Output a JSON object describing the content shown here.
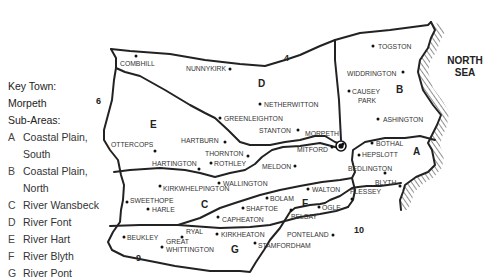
{
  "key": {
    "town_heading": "Key Town:",
    "town": "Morpeth",
    "subareas_heading": "Sub-Areas:",
    "subareas": [
      {
        "letter": "A",
        "line1": "Coastal Plain,",
        "line2": "South"
      },
      {
        "letter": "B",
        "line1": "Coastal Plain,",
        "line2": "North"
      },
      {
        "letter": "C",
        "line1": "River Wansbeck",
        "line2": ""
      },
      {
        "letter": "D",
        "line1": "River Font",
        "line2": ""
      },
      {
        "letter": "E",
        "line1": "River Hart",
        "line2": ""
      },
      {
        "letter": "F",
        "line1": "River Blyth",
        "line2": ""
      },
      {
        "letter": "G",
        "line1": "River Pont",
        "line2": ""
      }
    ]
  },
  "sea": {
    "line1": "NORTH",
    "line2": "SEA"
  },
  "area_labels": [
    {
      "t": "A",
      "x": 413,
      "y": 155
    },
    {
      "t": "B",
      "x": 396,
      "y": 93
    },
    {
      "t": "C",
      "x": 201,
      "y": 208
    },
    {
      "t": "D",
      "x": 258,
      "y": 87
    },
    {
      "t": "E",
      "x": 150,
      "y": 128
    },
    {
      "t": "F",
      "x": 302,
      "y": 207
    },
    {
      "t": "G",
      "x": 231,
      "y": 253
    }
  ],
  "boundary_numbers": [
    {
      "t": "4",
      "x": 284,
      "y": 61
    },
    {
      "t": "6",
      "x": 96,
      "y": 104
    },
    {
      "t": "9",
      "x": 136,
      "y": 261
    },
    {
      "t": "10",
      "x": 354,
      "y": 233
    }
  ],
  "towns": [
    {
      "name": "COMBILL",
      "label": "COMBHILL",
      "dx": 136,
      "dy": 56,
      "tx": 120,
      "ty": 66,
      "anchor": "start"
    },
    {
      "name": "NUNNYKIRK",
      "label": "NUNNYKIRK",
      "dx": 230,
      "dy": 69,
      "tx": 186,
      "ty": 71,
      "anchor": "start"
    },
    {
      "name": "TOGSTON",
      "label": "TOGSTON",
      "dx": 373,
      "dy": 46,
      "tx": 378,
      "ty": 49,
      "anchor": "start"
    },
    {
      "name": "WIDDRINGTON",
      "label": "WIDDRINGTON",
      "dx": 403,
      "dy": 72,
      "tx": 347,
      "ty": 76,
      "anchor": "start"
    },
    {
      "name": "CAUSEY",
      "label": "CAUSEY",
      "dx": 349,
      "dy": 91,
      "tx": 352,
      "ty": 94,
      "anchor": "start"
    },
    {
      "name": "PARK",
      "label": "PARK",
      "dx": null,
      "dy": null,
      "tx": 358,
      "ty": 103,
      "anchor": "start"
    },
    {
      "name": "NETHERWITTON",
      "label": "NETHERWITTON",
      "dx": 260,
      "dy": 104,
      "tx": 264,
      "ty": 107,
      "anchor": "start"
    },
    {
      "name": "ASHINGTON",
      "label": "ASHINGTON",
      "dx": 378,
      "dy": 119,
      "tx": 383,
      "ty": 122,
      "anchor": "start"
    },
    {
      "name": "GREENLEIGHTON",
      "label": "GREENLEIGHTON",
      "dx": 220,
      "dy": 118,
      "tx": 224,
      "ty": 121,
      "anchor": "start"
    },
    {
      "name": "STANTON",
      "label": "STANTON",
      "dx": 298,
      "dy": 130,
      "tx": 259,
      "ty": 133,
      "anchor": "start"
    },
    {
      "name": "HARTBURN",
      "label": "HARTBURN",
      "dx": 225,
      "dy": 142,
      "tx": 181,
      "ty": 143,
      "anchor": "start"
    },
    {
      "name": "MORPETH",
      "label": "MORPETH",
      "dx": 343,
      "dy": 144,
      "tx": 305,
      "ty": 136,
      "anchor": "start"
    },
    {
      "name": "BOTHAL",
      "label": "BOTHAL",
      "dx": 372,
      "dy": 143,
      "tx": 376,
      "ty": 146,
      "anchor": "start"
    },
    {
      "name": "OTTERCOPS",
      "label": "OTTERCOPS",
      "dx": 155,
      "dy": 151,
      "tx": 111,
      "ty": 147,
      "anchor": "start"
    },
    {
      "name": "MITFORD",
      "label": "MITFORD",
      "dx": 332,
      "dy": 147,
      "tx": 297,
      "ty": 152,
      "anchor": "start"
    },
    {
      "name": "THORNTON",
      "label": "THORNTON",
      "dx": 248,
      "dy": 156,
      "tx": 205,
      "ty": 156,
      "anchor": "start"
    },
    {
      "name": "HEPSLOTT",
      "label": "HEPSLOTT",
      "dx": 359,
      "dy": 155,
      "tx": 362,
      "ty": 157,
      "anchor": "start"
    },
    {
      "name": "HARTINGTON",
      "label": "HARTINGTON",
      "dx": 199,
      "dy": 169,
      "tx": 152,
      "ty": 166,
      "anchor": "start"
    },
    {
      "name": "ROTHLEY",
      "label": "ROTHLEY",
      "dx": 211,
      "dy": 163,
      "tx": 214,
      "ty": 166,
      "anchor": "start"
    },
    {
      "name": "MELDON",
      "label": "MELDON",
      "dx": 295,
      "dy": 166,
      "tx": 262,
      "ty": 169,
      "anchor": "start"
    },
    {
      "name": "BEDLINGTON",
      "label": "BEDLINGTON",
      "dx": 385,
      "dy": 173,
      "tx": 348,
      "ty": 171,
      "anchor": "start"
    },
    {
      "name": "WALLINGTON",
      "label": "WALLINGTON",
      "dx": 219,
      "dy": 183,
      "tx": 223,
      "ty": 186,
      "anchor": "start"
    },
    {
      "name": "BLYTH",
      "label": "BLYTH",
      "dx": 400,
      "dy": 186,
      "tx": 375,
      "ty": 185,
      "anchor": "start"
    },
    {
      "name": "KIRKWHELPINGTON",
      "label": "KIRKWHELPINGTON",
      "dx": 160,
      "dy": 186,
      "tx": 163,
      "ty": 191,
      "anchor": "start"
    },
    {
      "name": "WALTON",
      "label": "WALTON",
      "dx": 308,
      "dy": 189,
      "tx": 312,
      "ty": 192,
      "anchor": "start"
    },
    {
      "name": "PLESSEY",
      "label": "PLESSEY",
      "dx": 352,
      "dy": 199,
      "tx": 350,
      "ty": 194,
      "anchor": "start"
    },
    {
      "name": "SWEETHOPE",
      "label": "SWEETHOPE",
      "dx": 127,
      "dy": 202,
      "tx": 130,
      "ty": 203,
      "anchor": "start"
    },
    {
      "name": "BOLAM",
      "label": "BOLAM",
      "dx": 267,
      "dy": 198,
      "tx": 270,
      "ty": 201,
      "anchor": "start"
    },
    {
      "name": "HARLE",
      "label": "HARLE",
      "dx": 148,
      "dy": 209,
      "tx": 152,
      "ty": 212,
      "anchor": "start"
    },
    {
      "name": "SHAFTOE",
      "label": "SHAFTOE",
      "dx": 243,
      "dy": 208,
      "tx": 246,
      "ty": 211,
      "anchor": "start"
    },
    {
      "name": "OGLE",
      "label": "OGLE",
      "dx": 319,
      "dy": 207,
      "tx": 322,
      "ty": 210,
      "anchor": "start"
    },
    {
      "name": "BELSAY",
      "label": "BELSAY",
      "dx": 291,
      "dy": 210,
      "tx": 291,
      "ty": 219,
      "anchor": "start"
    },
    {
      "name": "CAPHEATON",
      "label": "CAPHEATON",
      "dx": 218,
      "dy": 217,
      "tx": 222,
      "ty": 222,
      "anchor": "start"
    },
    {
      "name": "RYAL",
      "label": "RYAL",
      "dx": 182,
      "dy": 237,
      "tx": 186,
      "ty": 234,
      "anchor": "start"
    },
    {
      "name": "KIRKHEATON",
      "label": "KIRKHEATON",
      "dx": 217,
      "dy": 234,
      "tx": 221,
      "ty": 237,
      "anchor": "start"
    },
    {
      "name": "PONTELAND",
      "label": "PONTELAND",
      "dx": 333,
      "dy": 235,
      "tx": 287,
      "ty": 237,
      "anchor": "start"
    },
    {
      "name": "BEUKLEY",
      "label": "BEUKLEY",
      "dx": 124,
      "dy": 237,
      "tx": 127,
      "ty": 240,
      "anchor": "start"
    },
    {
      "name": "GREAT",
      "label": "GREAT",
      "dx": 162,
      "dy": 247,
      "tx": 166,
      "ty": 244,
      "anchor": "start"
    },
    {
      "name": "WHITTINGTON",
      "label": "WHITTINGTON",
      "dx": null,
      "dy": null,
      "tx": 166,
      "ty": 252,
      "anchor": "start"
    },
    {
      "name": "STAMFORDHAM",
      "label": "STAMFORDHAM",
      "dx": 255,
      "dy": 243,
      "tx": 258,
      "ty": 248,
      "anchor": "start"
    }
  ],
  "key_town_marker": {
    "x": 341,
    "y": 146
  }
}
